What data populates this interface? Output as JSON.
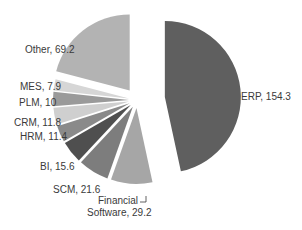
{
  "chart_data": {
    "type": "pie",
    "title": "",
    "exploded": true,
    "start": "12 o'clock",
    "direction": "clockwise",
    "slices": [
      {
        "label": "ERP",
        "value": 154.3,
        "text": "ERP, 154.3",
        "color": "#5f5f5f"
      },
      {
        "label": "Financial Software",
        "value": 29.2,
        "text_lines": [
          "Financial",
          "Software, 29.2"
        ],
        "color": "#a6a6a6"
      },
      {
        "label": "SCM",
        "value": 21.6,
        "text": "SCM, 21.6",
        "color": "#7d7d7d"
      },
      {
        "label": "BI",
        "value": 15.6,
        "text": "BI, 15.6",
        "color": "#4f4f4f"
      },
      {
        "label": "HRM",
        "value": 11.4,
        "text": "HRM, 11.4",
        "color": "#8a8a8a"
      },
      {
        "label": "CRM",
        "value": 11.8,
        "text": "CRM, 11.8",
        "color": "#cfcfcf"
      },
      {
        "label": "PLM",
        "value": 10,
        "text": "PLM, 10",
        "color": "#9a9a9a"
      },
      {
        "label": "MES",
        "value": 7.9,
        "text": "MES, 7.9",
        "color": "#d6d6d6"
      },
      {
        "label": "Other",
        "value": 69.2,
        "text": "Other, 69.2",
        "color": "#b3b3b3"
      }
    ],
    "legend": "none",
    "data_labels": "outside"
  }
}
